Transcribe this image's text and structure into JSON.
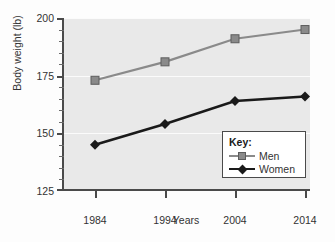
{
  "chart_data": {
    "type": "line",
    "title": "",
    "xlabel": "Years",
    "ylabel": "Body weight (lb)",
    "x": [
      1984,
      1994,
      2004,
      2014
    ],
    "categories": [
      "1984",
      "1994",
      "2004",
      "2014"
    ],
    "xlim": [
      1979,
      2019
    ],
    "ylim": [
      125,
      200
    ],
    "yticks": [
      125,
      150,
      175,
      200
    ],
    "ytick_labels": [
      "125",
      "150",
      "175",
      "200"
    ],
    "ytick_minor_step": 5,
    "grid": "horizontal-white-on-gray",
    "legend_position": "lower-right",
    "legend_title": "Key:",
    "series": [
      {
        "name": "Men",
        "values": [
          173,
          181,
          191,
          195
        ],
        "color": "#8a8a8a",
        "marker": "square"
      },
      {
        "name": "Women",
        "values": [
          145,
          154,
          164,
          166
        ],
        "color": "#1a1a1a",
        "marker": "diamond"
      }
    ],
    "plot_background": "#e9e9e9",
    "axis_color": "#4a4a4a"
  },
  "axes": {
    "y_title": "Body weight (lb)",
    "x_title": "Years"
  }
}
